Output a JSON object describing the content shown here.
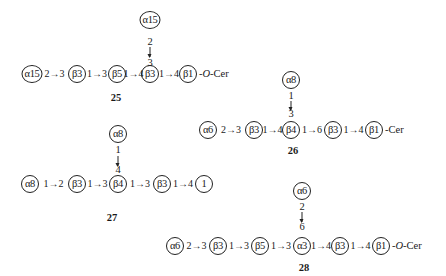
{
  "structures": [
    {
      "id": "25",
      "main_chain": [
        "α15",
        "β3",
        "β5",
        "β3",
        "β1"
      ],
      "linkages": [
        "2→3",
        "1→3",
        "1→4",
        "1→4"
      ],
      "terminal": "-O-Cer",
      "branch": {
        "node": "α15",
        "from": "2",
        "to": "3",
        "attached_to_index": 3
      }
    },
    {
      "id": "26",
      "main_chain": [
        "α6",
        "β3",
        "β4",
        "β3",
        "β1"
      ],
      "linkages": [
        "2→3",
        "1→4",
        "1→6",
        "1→4"
      ],
      "terminal": "-Cer",
      "branch": {
        "node": "α8",
        "from": "1",
        "to": "3",
        "attached_to_index": 2
      }
    },
    {
      "id": "27",
      "main_chain": [
        "α8",
        "β3",
        "β4",
        "β3",
        "1"
      ],
      "linkages": [
        "1→2",
        "1→3",
        "1→3",
        "1→4"
      ],
      "terminal": "",
      "branch": {
        "node": "α8",
        "from": "1",
        "to": "4",
        "attached_to_index": 2
      }
    },
    {
      "id": "28",
      "main_chain": [
        "α6",
        "β3",
        "β5",
        "α3",
        "β3",
        "β1"
      ],
      "linkages": [
        "2→3",
        "1→3",
        "1→3",
        "1→4",
        "1→4"
      ],
      "terminal": "-O-Cer",
      "branch": {
        "node": "α6",
        "from": "2",
        "to": "6",
        "attached_to_index": 3
      }
    }
  ],
  "glyphs": {
    "arrow": "→"
  }
}
